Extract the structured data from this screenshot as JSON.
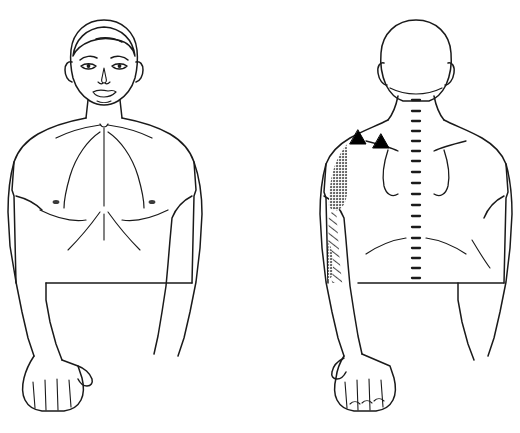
{
  "illustration": {
    "title": "Referred pain pattern diagram - deltoid / lateral upper arm",
    "subtitle": "Anterior and posterior body chart",
    "background_color": "#ffffff",
    "line_color": "#1a1a1a",
    "solid_shading_color": "#7a7a7a",
    "hatch_shading_color": "#555555",
    "marker_color": "#000000"
  },
  "views": [
    {
      "id": "anterior",
      "label": "Anterior view",
      "description": "Front-facing male figure, head to hips, arms hanging at sides",
      "features": [
        "face-with-eyes-nose-mouth",
        "hair",
        "ears",
        "neck",
        "clavicles",
        "sternal-notch",
        "pectoral-muscles",
        "nipples",
        "rib-contours",
        "abdomen",
        "arms",
        "hands"
      ],
      "pain_regions": [
        {
          "id": "anterior-deltoid-solid",
          "label": "Anterior deltoid essential zone",
          "shading": "solid",
          "side": "figure-left-shoulder",
          "intensity": "essential"
        },
        {
          "id": "anterior-lateral-arm-hatch",
          "label": "Lateral upper arm spillover zone",
          "shading": "stippled-hatch",
          "side": "figure-left-upper-arm",
          "intensity": "spillover"
        }
      ],
      "trigger_points": []
    },
    {
      "id": "posterior",
      "label": "Posterior view",
      "description": "Back-facing male figure, head to hips, arms hanging at sides",
      "features": [
        "back-of-head",
        "ears",
        "neck",
        "trapezius-slope",
        "spinal-column-dashes",
        "scapular-borders",
        "lower-back-contours",
        "arms",
        "hands"
      ],
      "pain_regions": [
        {
          "id": "posterior-deltoid-solid",
          "label": "Posterior deltoid essential zone",
          "shading": "solid",
          "side": "figure-right-shoulder",
          "intensity": "essential"
        },
        {
          "id": "posterior-lateral-arm-hatch",
          "label": "Posterior lateral arm spillover zone",
          "shading": "stippled-hatch",
          "side": "figure-right-upper-arm",
          "intensity": "spillover"
        },
        {
          "id": "posterior-distal-arm-solid",
          "label": "Distal lateral arm essential zone",
          "shading": "solid",
          "side": "figure-right-lower-upper-arm",
          "intensity": "essential"
        }
      ],
      "trigger_points": [
        {
          "id": "trigger-point-1",
          "label": "Trigger point 1",
          "marker": "filled-triangle",
          "location": "supraspinatus / upper scapular region"
        },
        {
          "id": "trigger-point-2",
          "label": "Trigger point 2",
          "marker": "filled-triangle",
          "location": "scapular spine region"
        }
      ]
    }
  ],
  "legend": {
    "solid": "Essential referred pain zone",
    "hatched": "Spillover referred pain zone",
    "triangle": "Trigger point"
  }
}
